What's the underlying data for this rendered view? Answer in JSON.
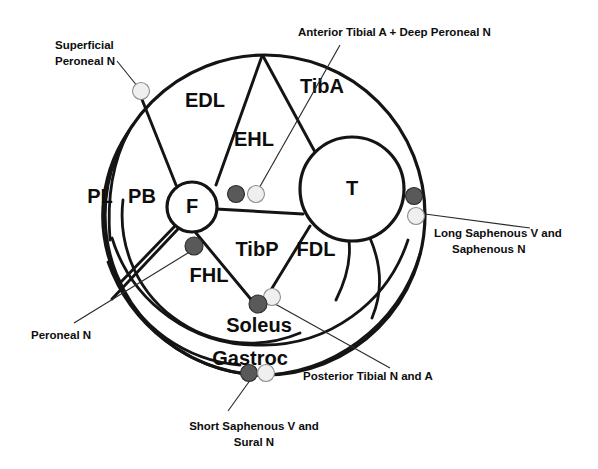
{
  "figure": {
    "background_color": "#ffffff",
    "line_color": "#141414",
    "dark_dot_color": "#59595a",
    "light_dot_color": "#efefef"
  },
  "bones": [
    {
      "id": "fibula",
      "label": "F",
      "cx": 192,
      "cy": 207,
      "r": 25
    },
    {
      "id": "tibia",
      "label": "T",
      "cx": 352,
      "cy": 189,
      "r": 52
    }
  ],
  "muscles": [
    {
      "id": "edl",
      "label": "EDL",
      "x": 205,
      "y": 102
    },
    {
      "id": "ehl",
      "label": "EHL",
      "x": 254,
      "y": 141
    },
    {
      "id": "tiba",
      "label": "TibA",
      "x": 322,
      "y": 88
    },
    {
      "id": "pl",
      "label": "PL",
      "x": 100,
      "y": 198
    },
    {
      "id": "pb",
      "label": "PB",
      "x": 142,
      "y": 198
    },
    {
      "id": "tibp",
      "label": "TibP",
      "x": 257,
      "y": 251
    },
    {
      "id": "fdl",
      "label": "FDL",
      "x": 316,
      "y": 251
    },
    {
      "id": "fhl",
      "label": "FHL",
      "x": 209,
      "y": 277
    },
    {
      "id": "soleus",
      "label": "Soleus",
      "x": 259,
      "y": 327
    },
    {
      "id": "gastroc",
      "label": "Gastroc",
      "x": 250,
      "y": 360
    }
  ],
  "neurovascular_dots": [
    {
      "id": "superficial-peroneal-n",
      "type": "light",
      "cx": 141,
      "cy": 91
    },
    {
      "id": "anterior-tibial-a-dark",
      "type": "dark",
      "cx": 236,
      "cy": 194
    },
    {
      "id": "deep-peroneal-n-light",
      "type": "light",
      "cx": 256,
      "cy": 194
    },
    {
      "id": "long-saphenous-v-dark",
      "type": "dark",
      "cx": 414,
      "cy": 196
    },
    {
      "id": "saphenous-n-light",
      "type": "light",
      "cx": 416,
      "cy": 216
    },
    {
      "id": "peroneal-n-dark",
      "type": "dark",
      "cx": 194,
      "cy": 246
    },
    {
      "id": "posterior-tibial-n-dark",
      "type": "dark",
      "cx": 258,
      "cy": 304
    },
    {
      "id": "posterior-tibial-a-light",
      "type": "light",
      "cx": 272,
      "cy": 297
    },
    {
      "id": "short-saphenous-v-dark",
      "type": "dark",
      "cx": 249,
      "cy": 373
    },
    {
      "id": "sural-n-light",
      "type": "light",
      "cx": 266,
      "cy": 373
    }
  ],
  "callouts": [
    {
      "id": "superficial-peroneal-n",
      "lines": [
        "Superficial",
        "Peroneal N"
      ],
      "anchor": "start",
      "text_x": 55,
      "text_y": 46,
      "line_height": 16,
      "leader": [
        [
          117,
          61
        ],
        [
          138,
          87
        ]
      ]
    },
    {
      "id": "anterior-tibial-a-deep-peroneal-n",
      "lines": [
        "Anterior Tibial A + Deep Peroneal N"
      ],
      "anchor": "start",
      "text_x": 298,
      "text_y": 33,
      "line_height": 16,
      "leader": [
        [
          340,
          45
        ],
        [
          258,
          190
        ]
      ]
    },
    {
      "id": "long-saphenous-v-saphenous-n",
      "lines": [
        "Long Saphenous V and",
        "Saphenous N"
      ],
      "anchor": "start",
      "text_x": 434,
      "text_y": 234,
      "line_height": 16,
      "leader": [
        [
          425,
          214
        ],
        [
          530,
          228
        ]
      ]
    },
    {
      "id": "peroneal-n",
      "lines": [
        "Peroneal N"
      ],
      "anchor": "start",
      "text_x": 31,
      "text_y": 336,
      "line_height": 16,
      "leader": [
        [
          74,
          323
        ],
        [
          196,
          248
        ]
      ]
    },
    {
      "id": "posterior-tibial-n-a",
      "lines": [
        "Posterior Tibial N and A"
      ],
      "anchor": "start",
      "text_x": 303,
      "text_y": 377,
      "line_height": 16,
      "leader": [
        [
          268,
          300
        ],
        [
          390,
          368
        ]
      ]
    },
    {
      "id": "short-saphenous-v-sural-n",
      "lines": [
        "Short Saphenous V and",
        "Sural N"
      ],
      "anchor": "center",
      "text_x": 254,
      "text_y": 427,
      "line_height": 16,
      "leader": [
        [
          251,
          379
        ],
        [
          228,
          411
        ]
      ]
    }
  ]
}
